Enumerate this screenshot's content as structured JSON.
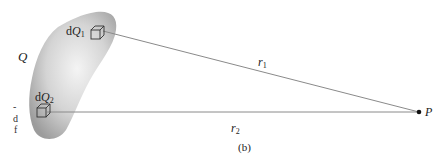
{
  "figure": {
    "caption": "(b)",
    "body_label": "Q",
    "element1": {
      "prefix": "d",
      "symbol": "Q",
      "subscript": "1"
    },
    "element2": {
      "prefix": "d",
      "symbol": "Q",
      "subscript": "2"
    },
    "distance1": {
      "symbol": "r",
      "subscript": "1"
    },
    "distance2": {
      "symbol": "r",
      "subscript": "2"
    },
    "point_label": "P",
    "left_edge_fragments": [
      "-",
      "d",
      "f"
    ]
  },
  "colors": {
    "line": "#8a8a8a",
    "blob_light": "#f2f2f2",
    "blob_dark": "#9a9a9a",
    "text": "#222222"
  }
}
